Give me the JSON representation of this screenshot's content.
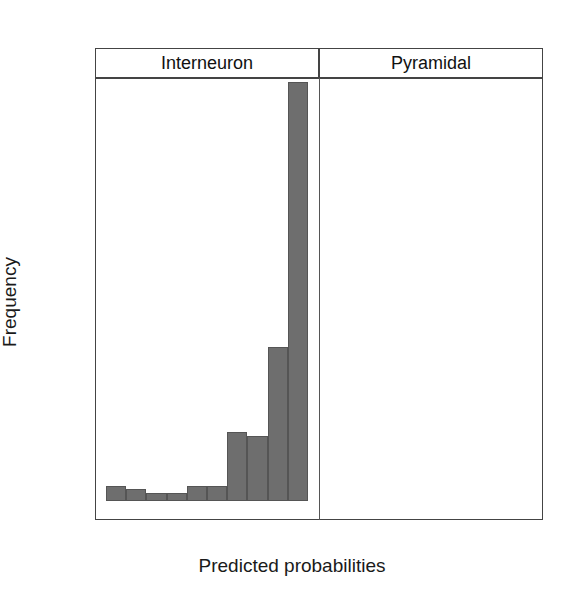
{
  "chart_data": {
    "type": "bar",
    "title": "",
    "xlabel": "Predicted probabilities",
    "ylabel": "Frequency",
    "ylim": [
      0,
      115
    ],
    "xlim": [
      -0.05,
      1.05
    ],
    "grid": false,
    "legend_position": "none",
    "panel_layout": "1 row x 2 columns, shared y-axis; left panel x-axis ticks on bottom, right panel x-axis ticks on top",
    "y_ticks": [
      0,
      20,
      40,
      60,
      80,
      100
    ],
    "y_tick_labels": [
      "0",
      "20",
      "40",
      "60",
      "80",
      "100"
    ],
    "x_ticks": [
      0.0,
      0.2,
      0.4,
      0.6,
      0.8,
      1.0
    ],
    "x_tick_labels": [
      "0.0",
      "0.2",
      "0.4",
      "0.6",
      "0.8",
      "1.0"
    ],
    "bin_width": 0.1,
    "panels": [
      {
        "name": "Interneuron",
        "fill_color": "#6e6e6e",
        "bin_edges": [
          0.0,
          0.1,
          0.2,
          0.3,
          0.4,
          0.5,
          0.6,
          0.7,
          0.8,
          0.9,
          1.0
        ],
        "bin_centers": [
          0.05,
          0.15,
          0.25,
          0.35,
          0.45,
          0.55,
          0.65,
          0.75,
          0.85,
          0.95
        ],
        "values": [
          4,
          3,
          2,
          2,
          4,
          4,
          18,
          17,
          40,
          109
        ]
      },
      {
        "name": "Pyramidal",
        "fill_color": "#dcdcdc",
        "bin_edges": [
          0.0,
          0.1,
          0.2,
          0.3,
          0.4,
          0.5,
          0.6,
          0.7,
          0.8,
          0.9,
          1.0
        ],
        "bin_centers": [
          0.05,
          0.15,
          0.25,
          0.35,
          0.45,
          0.55,
          0.65,
          0.75,
          0.85,
          0.95
        ],
        "values": [
          61,
          20,
          8,
          9,
          9,
          6,
          7,
          3,
          5,
          0
        ]
      }
    ]
  },
  "labels": {
    "xlabel": "Predicted probabilities",
    "ylabel": "Frequency",
    "strip_left": "Interneuron",
    "strip_right": "Pyramidal"
  },
  "colors": {
    "interneuron_fill": "#6e6e6e",
    "pyramidal_fill": "#dcdcdc",
    "axis": "#444444",
    "text": "#1a1a1a"
  }
}
